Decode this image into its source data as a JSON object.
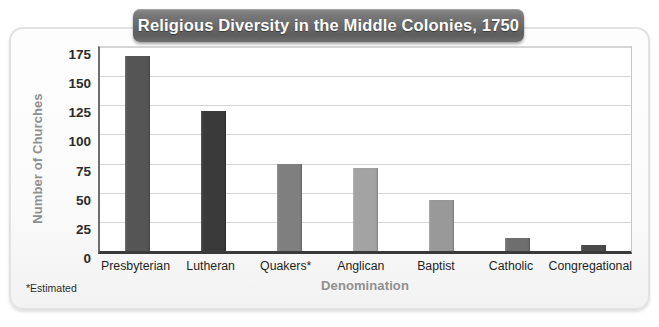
{
  "chart_data": {
    "type": "bar",
    "title": "Religious Diversity in the Middle Colonies, 1750",
    "xlabel": "Denomination",
    "ylabel": "Number of Churches",
    "categories": [
      "Presbyterian",
      "Lutheran",
      "Quakers*",
      "Anglican",
      "Baptist",
      "Catholic",
      "Congregational"
    ],
    "values": [
      167,
      120,
      75,
      71,
      44,
      11,
      5
    ],
    "bar_colors": [
      "#555555",
      "#3a3a3a",
      "#7f7f7f",
      "#a3a3a3",
      "#999999",
      "#6e6e6e",
      "#4a4a4a"
    ],
    "ylim": [
      0,
      175
    ],
    "y_ticks": [
      0,
      25,
      50,
      75,
      100,
      125,
      150,
      175
    ],
    "y_tick_labels": [
      "0",
      "25",
      "50",
      "75",
      "100",
      "125",
      "150",
      "175"
    ],
    "grid": true,
    "legend": null,
    "footnote": "*Estimated"
  },
  "style": {
    "title_bg": "#6a6a6a",
    "title_color": "#ffffff",
    "axis_label_color": "#8f8f8f",
    "plot_bg": "#ffffff",
    "gridline_color": "#d5d5d5",
    "frame_bg": "#fbfbfb"
  }
}
